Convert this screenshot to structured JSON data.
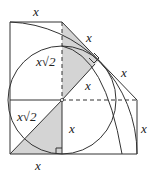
{
  "diagram": {
    "type": "geometry",
    "colors": {
      "stroke": "#333333",
      "shade": "#d4d4d4",
      "background": "#ffffff"
    },
    "labels": {
      "top": "x",
      "diag_upper": "x",
      "diag_lower": "x",
      "perp_inner": "x",
      "left_upper": "x√2",
      "left_lower": "x√2",
      "mid_vertical": "x",
      "right_vertical": "x",
      "bottom": "x"
    }
  }
}
